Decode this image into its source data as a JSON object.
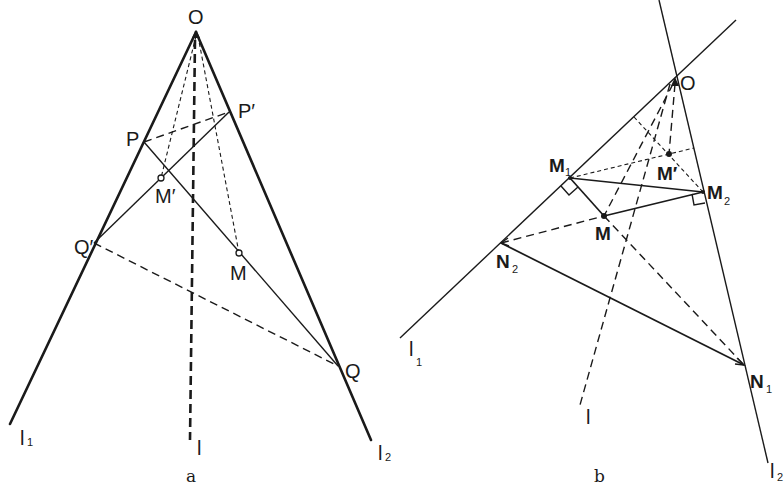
{
  "figure_a": {
    "caption": "a",
    "labels": {
      "O": "O",
      "P": "P",
      "P_prime": "P′",
      "Q": "Q",
      "Q_prime": "Q′",
      "M": "M",
      "M_prime": "M′",
      "l": "l",
      "l1": "l",
      "l1_sub": "1",
      "l2": "l",
      "l2_sub": "2"
    }
  },
  "figure_b": {
    "caption": "b",
    "labels": {
      "O": "O",
      "M": "M",
      "M_prime": "M′",
      "M1": "M",
      "M1_sub": "1",
      "M2": "M",
      "M2_sub": "2",
      "N1": "N",
      "N1_sub": "1",
      "N2": "N",
      "N2_sub": "2",
      "l": "l",
      "l1": "l",
      "l1_sub": "1",
      "l2": "l",
      "l2_sub": "2"
    }
  }
}
